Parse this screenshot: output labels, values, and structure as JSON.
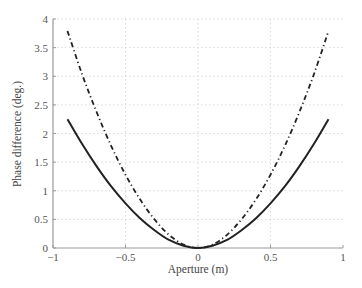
{
  "chart_data": {
    "type": "line",
    "title": "",
    "xlabel": "Aperture (m)",
    "ylabel": "Phase difference (deg.)",
    "xlim": [
      -1,
      1
    ],
    "ylim": [
      0,
      4
    ],
    "xticks": [
      -1,
      -0.5,
      0,
      0.5,
      1
    ],
    "xtick_labels": [
      "−1",
      "−0.5",
      "0",
      "0.5",
      "1"
    ],
    "yticks": [
      0,
      0.5,
      1,
      1.5,
      2,
      2.5,
      3,
      3.5,
      4
    ],
    "ytick_labels": [
      "0",
      "0.5",
      "1",
      "1.5",
      "2",
      "2.5",
      "3",
      "3.5",
      "4"
    ],
    "grid": true,
    "legend": null,
    "x": [
      -0.9,
      -0.8,
      -0.7,
      -0.6,
      -0.5,
      -0.4,
      -0.3,
      -0.2,
      -0.1,
      0,
      0.1,
      0.2,
      0.3,
      0.4,
      0.5,
      0.6,
      0.7,
      0.8,
      0.9
    ],
    "series": [
      {
        "name": "solid",
        "style": "solid",
        "color": "#222222",
        "values": [
          2.25,
          1.82,
          1.43,
          1.08,
          0.78,
          0.52,
          0.31,
          0.14,
          0.04,
          0,
          0.04,
          0.14,
          0.31,
          0.52,
          0.78,
          1.08,
          1.43,
          1.82,
          2.25
        ]
      },
      {
        "name": "dash-dot",
        "style": "dashdot",
        "color": "#222222",
        "values": [
          3.79,
          3.04,
          2.38,
          1.79,
          1.28,
          0.85,
          0.5,
          0.23,
          0.06,
          0,
          0.06,
          0.23,
          0.5,
          0.85,
          1.28,
          1.79,
          2.38,
          3.04,
          3.79
        ]
      }
    ]
  }
}
